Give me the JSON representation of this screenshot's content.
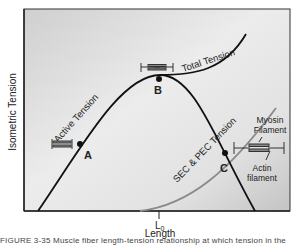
{
  "figure": {
    "y_axis_label": "Isometric Tension",
    "x_axis_label": "Length",
    "x_tick_label": "L",
    "x_tick_subscript": "0",
    "curves": [
      {
        "name": "active-tension",
        "label": "Active Tension",
        "color": "#111111"
      },
      {
        "name": "total-tension",
        "label": "Total Tension",
        "color": "#111111"
      },
      {
        "name": "passive-tension",
        "label": "SEC & PEC Tension",
        "color": "#8a8a8a"
      }
    ],
    "points": [
      {
        "id": "A",
        "label": "A"
      },
      {
        "id": "B",
        "label": "B"
      },
      {
        "id": "C",
        "label": "C"
      }
    ],
    "sarcomere_labels": {
      "myosin_line1": "Myosin",
      "myosin_line2": "Filament",
      "actin_line1": "Actin",
      "actin_line2": "filament"
    },
    "caption": "FIGURE 3-35  Muscle fiber length-tension relationship at which tension in the"
  },
  "colors": {
    "plot_bg_light": "#f4f4f4",
    "plot_bg_dark": "#c8c8c8",
    "border": "#333333",
    "active_curve": "#111111",
    "passive_curve": "#8a8a8a"
  }
}
